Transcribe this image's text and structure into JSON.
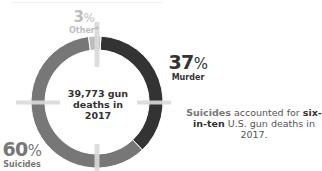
{
  "chart_data": {
    "type": "pie",
    "variant": "donut",
    "title": "",
    "center_label": "39,773 gun deaths in 2017",
    "slices": [
      {
        "label": "Suicides",
        "value": 60,
        "display": "60",
        "color": "#777777"
      },
      {
        "label": "Other*",
        "value": 3,
        "display": "3",
        "color": "#bdbdbd"
      },
      {
        "label": "Murder",
        "value": 37,
        "display": "37",
        "color": "#333333"
      }
    ],
    "percent_symbol": "%",
    "annotation": {
      "part1": "Suicides",
      "part2": " accounted for ",
      "part3": "six-in-ten",
      "part4": " U.S. gun deaths in 2017."
    },
    "crosshair_color": "#d9d9d9"
  }
}
